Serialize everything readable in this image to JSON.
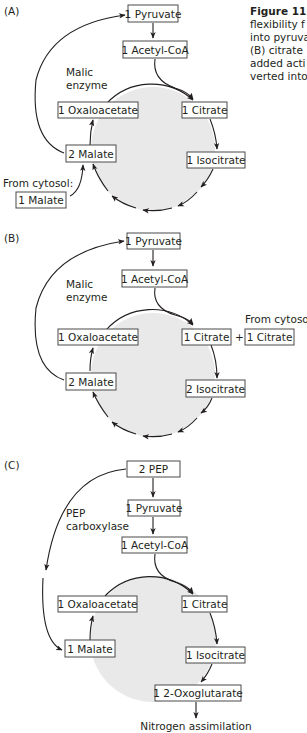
{
  "caption": {
    "title_fragment": "Figure 11.",
    "lines": [
      "flexibility f",
      "into pyruva",
      "(B) citrate",
      "added acti",
      "verted into"
    ]
  },
  "colors": {
    "cycle_fill": "#e9e9e9",
    "box_border": "#4a4a4a",
    "text": "#231f20"
  },
  "panels": [
    {
      "id": "A",
      "label": "(A)",
      "enzyme_label": [
        "Malic",
        "enzyme"
      ],
      "nodes": {
        "top": "1 Pyruvate",
        "acetyl": "1 Acetyl-CoA",
        "oaa": "1 Oxaloacetate",
        "citrate": "1 Citrate",
        "malate": "2 Malate",
        "isocitrate": "1 Isocitrate"
      },
      "cytosol_label": "From cytosol:",
      "cytosol_input": "1 Malate"
    },
    {
      "id": "B",
      "label": "(B)",
      "enzyme_label": [
        "Malic",
        "enzyme"
      ],
      "nodes": {
        "top": "1 Pyruvate",
        "acetyl": "1 Acetyl-CoA",
        "oaa": "1 Oxaloacetate",
        "citrate": "1 Citrate",
        "malate": "2 Malate",
        "isocitrate": "2 Isocitrate"
      },
      "plus": "+",
      "cytosol_label": "From cytosol:",
      "cytosol_input": "1 Citrate"
    },
    {
      "id": "C",
      "label": "(C)",
      "enzyme_label": [
        "PEP",
        "carboxylase"
      ],
      "nodes": {
        "pep": "2 PEP",
        "top": "1 Pyruvate",
        "acetyl": "1 Acetyl-CoA",
        "oaa": "1 Oxaloacetate",
        "citrate": "1 Citrate",
        "malate": "1 Malate",
        "isocitrate": "1 Isocitrate",
        "oxoglutarate": "1 2-Oxoglutarate"
      },
      "output": "Nitrogen assimilation"
    }
  ]
}
